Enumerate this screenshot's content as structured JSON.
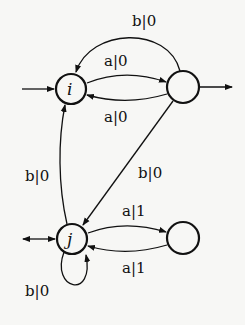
{
  "diagram": {
    "type": "finite-state transducer",
    "states": [
      {
        "id": "i",
        "label": "i",
        "initial": true,
        "final": false
      },
      {
        "id": "q1",
        "label": "",
        "initial": false,
        "final": true
      },
      {
        "id": "j",
        "label": "j",
        "initial": true,
        "final": true
      },
      {
        "id": "q3",
        "label": "",
        "initial": false,
        "final": false
      }
    ],
    "edges": [
      {
        "from": "i",
        "to": "q1",
        "label": "a|0"
      },
      {
        "from": "q1",
        "to": "i",
        "label": "a|0"
      },
      {
        "from": "q1",
        "to": "i",
        "label": "b|0"
      },
      {
        "from": "q1",
        "to": "j",
        "label": "b|0"
      },
      {
        "from": "j",
        "to": "i",
        "label": "b|0"
      },
      {
        "from": "j",
        "to": "q3",
        "label": "a|1"
      },
      {
        "from": "q3",
        "to": "j",
        "label": "a|1"
      },
      {
        "from": "j",
        "to": "j",
        "label": "b|0"
      }
    ],
    "labels": {
      "top_b0": "b|0",
      "i_q1_a0": "a|0",
      "q1_i_a0": "a|0",
      "j_i_b0": "b|0",
      "q1_j_b0": "b|0",
      "j_q3_a1": "a|1",
      "q3_j_a1": "a|1",
      "loop_b0": "b|0"
    },
    "state_labels": {
      "i": "i",
      "j": "j"
    }
  }
}
